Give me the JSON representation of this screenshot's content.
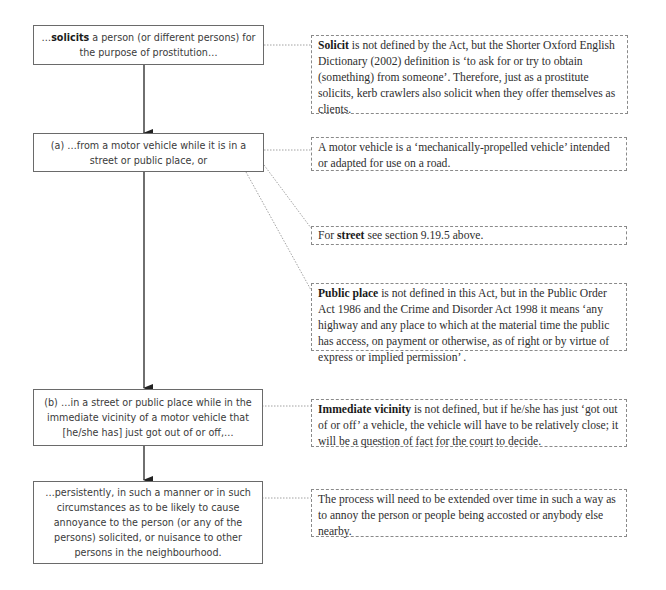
{
  "flow_boxes": [
    {
      "bold": "solicits",
      "pre": "…",
      "post": " a person (or different persons) for the purpose of prostitution…"
    },
    {
      "pre": "(a) …from a motor vehicle while it is in a street or public place, or"
    },
    {
      "pre": "(b) …in a street or public place while in the immediate vicinity of a motor vehicle that [he/she has] just got out of or off,…"
    },
    {
      "pre": "…persistently, in such a manner or in such circumstances as to be likely to cause annoyance to the person (or any of the persons) solicited, or nuisance to other persons in the neighbourhood."
    }
  ],
  "notes": [
    {
      "bold": "Solicit",
      "text": " is not defined by the Act, but the Shorter Oxford English Dictionary (2002) definition is ‘to ask for or try to obtain (something) from someone’. Therefore, just as a prostitute solicits, kerb crawlers also solicit when they offer themselves as clients."
    },
    {
      "bold": "",
      "text": "A motor vehicle is a ‘mechanically-propelled vehicle’ intended or adapted for use on a road."
    },
    {
      "pre": "For ",
      "bold": "street",
      "text": " see section 9.19.5 above."
    },
    {
      "bold": "Public place",
      "text": " is not defined in this Act, but in the Public Order Act 1986 and the Crime and Disorder Act 1998 it means ‘any highway and any place to which at the material time the public has access, on payment or otherwise, as of right or by virtue of express or implied permission’ ."
    },
    {
      "bold": "Immediate vicinity",
      "text": " is not defined, but if he/she has just ‘got out of or off’ a vehicle, the vehicle will have to be relatively close; it will be a question of fact for the court to decide."
    },
    {
      "bold": "",
      "text": "The process will need to be extended over time in such a way as to annoy the person or people being accosted or anybody else nearby."
    }
  ],
  "colors": {
    "solid_border": "#6a6a6a",
    "dashed_border": "#8a8a8a",
    "arrow": "#222222"
  }
}
